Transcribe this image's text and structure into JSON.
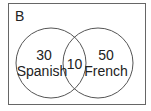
{
  "diagram": {
    "type": "venn",
    "universal_set_label": "B",
    "sets": [
      {
        "name": "Spanish",
        "only_count": "30"
      },
      {
        "name": "French",
        "only_count": "50"
      }
    ],
    "intersection_count": "10",
    "colors": {
      "stroke": "#555555",
      "text": "#222222",
      "background": "#ffffff"
    }
  }
}
